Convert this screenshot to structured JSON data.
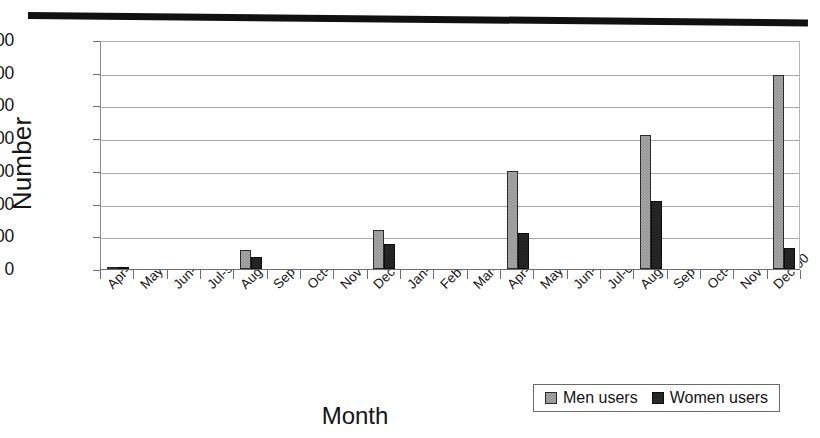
{
  "chart_data": {
    "type": "bar",
    "title": "",
    "xlabel": "Month",
    "ylabel": "Number",
    "ylim": [
      0,
      700
    ],
    "ytick_values": [
      0,
      100,
      200,
      300,
      400,
      500,
      600,
      700
    ],
    "ytick_labels": [
      "0",
      "100",
      "200",
      "300",
      "400",
      "500",
      "600",
      "700"
    ],
    "grid": true,
    "legend_position": "bottom-right",
    "categories": [
      "Apr-99",
      "May-99",
      "Jun-99",
      "Jul-99",
      "Aug-99",
      "Sep-99",
      "Oct-99",
      "Nov-99",
      "Dec-99",
      "Jan-00",
      "Feb-00",
      "Mar-00",
      "Apr-00",
      "May-00",
      "Jun-00",
      "Jul-00",
      "Aug-00",
      "Sep-00",
      "Oct-00",
      "Nov-00",
      "Dec-00"
    ],
    "series": [
      {
        "name": "Men users",
        "color": "#a8a8a8",
        "values": [
          4,
          0,
          0,
          0,
          58,
          0,
          0,
          0,
          118,
          0,
          0,
          0,
          300,
          0,
          0,
          0,
          410,
          0,
          0,
          0,
          592
        ]
      },
      {
        "name": "Women users",
        "color": "#1d1d1d",
        "values": [
          2,
          0,
          0,
          0,
          38,
          0,
          0,
          0,
          75,
          0,
          0,
          0,
          110,
          0,
          0,
          0,
          207,
          0,
          0,
          0,
          65
        ]
      }
    ]
  },
  "legend": {
    "items": [
      {
        "label": "Men users",
        "swatch": "men-swatch"
      },
      {
        "label": "Women users",
        "swatch": "women-swatch"
      }
    ]
  }
}
